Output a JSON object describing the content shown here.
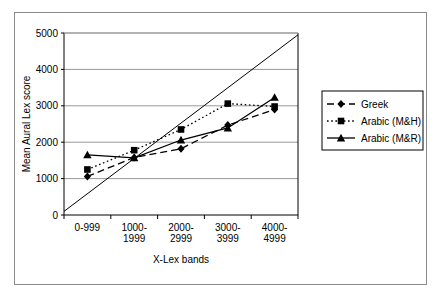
{
  "figure": {
    "border_color": "#8a8a8a",
    "background": "#ffffff",
    "plot_line_color": "#000000",
    "gridline_color": "#999999"
  },
  "chart_data": {
    "type": "line",
    "title": "",
    "xlabel": "X-Lex bands",
    "ylabel": "Mean Aural Lex score",
    "categories": [
      "0-999",
      "1000-1999",
      "2000-2999",
      "3000-3999",
      "4000-4999"
    ],
    "category_lines": [
      [
        "0-999",
        ""
      ],
      [
        "1000-",
        "1999"
      ],
      [
        "2000-",
        "2999"
      ],
      [
        "3000-",
        "3999"
      ],
      [
        "4000-",
        "4999"
      ]
    ],
    "ylim": [
      0,
      5000
    ],
    "yticks": [
      0,
      1000,
      2000,
      3000,
      4000,
      5000
    ],
    "ytick_labels": [
      "0",
      "1000",
      "2000",
      "3000",
      "4000",
      "5000"
    ],
    "grid": true,
    "grid_axis": "y",
    "legend_position": "right",
    "series": [
      {
        "name": "Greek",
        "marker": "diamond",
        "linestyle": "dashed",
        "color": "#000000",
        "values": [
          1060,
          1580,
          1820,
          2470,
          2900
        ]
      },
      {
        "name": "Arabic (M&H)",
        "marker": "square",
        "linestyle": "dotted",
        "color": "#000000",
        "values": [
          1250,
          1780,
          2350,
          3060,
          2980
        ]
      },
      {
        "name": "Arabic (M&R)",
        "marker": "triangle",
        "linestyle": "solid",
        "color": "#000000",
        "values": [
          1650,
          1570,
          2060,
          2390,
          3230
        ]
      }
    ],
    "reference_line": {
      "name": "diagonal-reference-line",
      "linestyle": "solid",
      "color": "#000000",
      "from": [
        0,
        100
      ],
      "to": [
        5000,
        4950
      ]
    }
  }
}
